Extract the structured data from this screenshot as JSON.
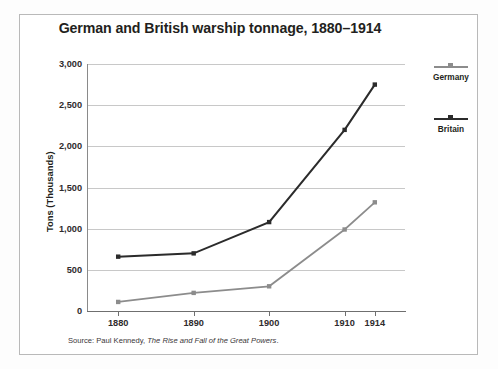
{
  "chart_data": {
    "type": "line",
    "title": "German and British warship tonnage, 1880–1914",
    "xlabel": "",
    "ylabel": "Tons (Thousands)",
    "categories": [
      "1880",
      "1890",
      "1900",
      "1910",
      "1914"
    ],
    "x": [
      1880,
      1890,
      1900,
      1910,
      1914
    ],
    "xlim": [
      1876,
      1918
    ],
    "ylim": [
      0,
      3000
    ],
    "y_ticks": [
      0,
      500,
      1000,
      1500,
      2000,
      2500,
      3000
    ],
    "y_tick_labels": [
      "0",
      "500",
      "1,000",
      "1,500",
      "2,000",
      "2,500",
      "3,000"
    ],
    "x_tick_labels": [
      "1880",
      "1890",
      "1900",
      "1910",
      "1914"
    ],
    "grid": "horizontal",
    "legend_position": "right",
    "series": [
      {
        "name": "Germany",
        "color": "#8c8c8c",
        "values": [
          110,
          220,
          300,
          990,
          1320
        ]
      },
      {
        "name": "Britain",
        "color": "#2b2b2b",
        "values": [
          660,
          700,
          1080,
          2200,
          2750
        ]
      }
    ],
    "annotations": [
      "Source: Paul Kennedy, The Rise and Fall of the Great Powers."
    ]
  },
  "title": {
    "text": "German and British warship tonnage, 1880–1914"
  },
  "axes": {
    "y_title": "Tons (Thousands)",
    "y_labels": [
      "3,000",
      "2,500",
      "2,000",
      "1,500",
      "1,000",
      "500",
      "0"
    ],
    "x_labels": [
      "1880",
      "1890",
      "1900",
      "1910",
      "1914"
    ]
  },
  "legend": {
    "entries": [
      {
        "label": "Germany",
        "color": "#8c8c8c"
      },
      {
        "label": "Britain",
        "color": "#2b2b2b"
      }
    ]
  },
  "source": {
    "prefix": "Source: Paul Kennedy, ",
    "work": "The Rise and Fall of the Great Powers",
    "suffix": "."
  },
  "colors": {
    "germany": "#8c8c8c",
    "britain": "#2b2b2b",
    "gridline": "#c8c8c8",
    "axis": "#6f6f6f",
    "frame": "#b9b9b9",
    "text": "#231f20"
  }
}
